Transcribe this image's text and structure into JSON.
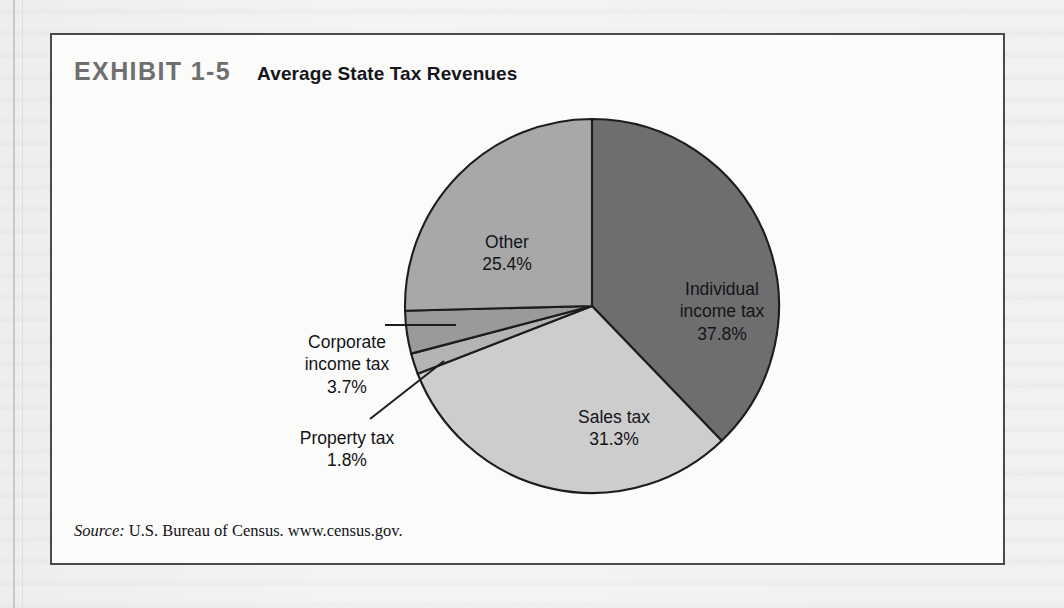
{
  "exhibit": {
    "number": "EXHIBIT 1-5",
    "title": "Average State Tax Revenues",
    "source_label": "Source:",
    "source_text": "U.S. Bureau of Census. www.census.gov."
  },
  "labels": {
    "other": {
      "name": "Other",
      "value": "25.4%"
    },
    "individual": {
      "name_line1": "Individual",
      "name_line2": "income tax",
      "value": "37.8%"
    },
    "sales": {
      "name": "Sales tax",
      "value": "31.3%"
    },
    "corporate": {
      "name_line1": "Corporate",
      "name_line2": "income tax",
      "value": "3.7%"
    },
    "property": {
      "name": "Property tax",
      "value": "1.8%"
    }
  },
  "colors": {
    "individual": "#6e6e6e",
    "sales": "#cdcdcd",
    "property": "#b4b4b4",
    "corporate": "#9a9a9a",
    "other": "#a8a8a8",
    "outline": "#1d1d1d",
    "exhibit_number": "#6f6f6f",
    "title": "#15151a",
    "frame": "#4a4a4a"
  },
  "chart_data": {
    "type": "pie",
    "title": "Average State Tax Revenues",
    "categories": [
      "Individual income tax",
      "Sales tax",
      "Property tax",
      "Corporate income tax",
      "Other"
    ],
    "values": [
      37.8,
      31.3,
      1.8,
      3.7,
      25.4
    ],
    "value_labels": [
      "37.8%",
      "31.3%",
      "1.8%",
      "3.7%",
      "25.4%"
    ],
    "units": "percent",
    "total": 100.0,
    "start_angle_deg": 0,
    "direction": "clockwise",
    "legend": "none",
    "labels_placement": "inside slices with leader lines for small slices",
    "source": "U.S. Bureau of Census. www.census.gov."
  }
}
